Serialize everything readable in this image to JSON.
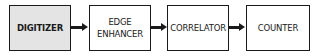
{
  "diagram": {
    "type": "block-flow",
    "direction": "left-to-right",
    "blocks": [
      {
        "id": "digitizer",
        "label": "DIGITIZER",
        "shaded": true
      },
      {
        "id": "edge-enhancer",
        "label": "EDGE\nENHANCER",
        "shaded": false
      },
      {
        "id": "correlator",
        "label": "CORRELATOR",
        "shaded": false
      },
      {
        "id": "counter",
        "label": "COUNTER",
        "shaded": false
      }
    ],
    "arrows": [
      {
        "from": "digitizer",
        "to": "edge-enhancer"
      },
      {
        "from": "edge-enhancer",
        "to": "correlator"
      },
      {
        "from": "correlator",
        "to": "counter"
      }
    ]
  }
}
